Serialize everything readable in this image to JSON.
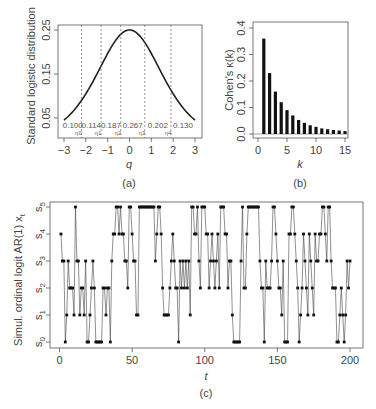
{
  "chart_data": [
    {
      "panel": "(a)",
      "type": "line",
      "title": "",
      "xlabel": "q",
      "ylabel": "Standard logistic distribution",
      "xlim": [
        -3,
        3
      ],
      "ylim": [
        0.0,
        0.25
      ],
      "xticks": [
        -3,
        -2,
        -1,
        0,
        1,
        2,
        3
      ],
      "yticks": [
        0.05,
        0.15,
        0.25
      ],
      "function": "logistic pdf e^-q/(1+e^-q)^2",
      "thresholds": [
        {
          "name": "η0",
          "q": -2.2
        },
        {
          "name": "η1",
          "q": -1.3
        },
        {
          "name": "η2",
          "q": -0.4
        },
        {
          "name": "η3",
          "q": 0.7
        },
        {
          "name": "η4",
          "q": 1.9
        }
      ],
      "region_probabilities": [
        "0.100",
        "0.114",
        "0.187",
        "0.267",
        "0.202",
        "0.130"
      ],
      "grid": false
    },
    {
      "panel": "(b)",
      "type": "bar",
      "title": "",
      "xlabel": "k",
      "ylabel": "Cohen's κ(k)",
      "xlim": [
        0,
        15
      ],
      "ylim": [
        0.0,
        0.4
      ],
      "xticks": [
        0,
        5,
        10,
        15
      ],
      "yticks": [
        0.0,
        0.1,
        0.2,
        0.3,
        0.4
      ],
      "categories": [
        1,
        2,
        3,
        4,
        5,
        6,
        7,
        8,
        9,
        10,
        11,
        12,
        13,
        14,
        15
      ],
      "values": [
        0.36,
        0.23,
        0.16,
        0.12,
        0.09,
        0.07,
        0.053,
        0.042,
        0.033,
        0.027,
        0.021,
        0.018,
        0.015,
        0.013,
        0.011
      ],
      "grid": false
    },
    {
      "panel": "(c)",
      "type": "line",
      "title": "",
      "xlabel": "t",
      "ylabel": "Simul. ordinal logit AR(1) x_t",
      "xlim": [
        0,
        200
      ],
      "xticks": [
        0,
        50,
        100,
        150,
        200
      ],
      "ylevels": [
        "s0",
        "s1",
        "s2",
        "s3",
        "s4",
        "s5"
      ],
      "markers": "points connected by lines",
      "values": [
        4,
        3,
        3,
        0,
        1,
        3,
        2,
        2,
        2,
        1,
        5,
        3,
        3,
        1,
        2,
        2,
        1,
        3,
        0,
        0,
        1,
        2,
        3,
        2,
        0,
        0,
        0,
        0,
        0,
        2,
        2,
        1,
        2,
        2,
        0,
        3,
        4,
        4,
        5,
        5,
        4,
        5,
        4,
        4,
        3,
        3,
        2,
        5,
        5,
        4,
        3,
        3,
        1,
        1,
        5,
        5,
        5,
        5,
        5,
        5,
        5,
        5,
        5,
        5,
        5,
        3,
        4,
        5,
        5,
        4,
        2,
        1,
        1,
        1,
        1,
        2,
        3,
        4,
        3,
        2,
        2,
        0,
        3,
        2,
        3,
        2,
        3,
        2,
        3,
        1,
        5,
        5,
        4,
        4,
        5,
        3,
        2,
        5,
        5,
        5,
        4,
        4,
        2,
        3,
        4,
        3,
        2,
        3,
        4,
        2,
        5,
        5,
        5,
        4,
        4,
        2,
        3,
        3,
        1,
        0,
        0,
        0,
        0,
        0,
        3,
        5,
        2,
        2,
        4,
        5,
        5,
        5,
        5,
        5,
        5,
        5,
        5,
        3,
        2,
        2,
        0,
        3,
        2,
        2,
        2,
        3,
        5,
        5,
        4,
        3,
        2,
        2,
        1,
        3,
        0,
        0,
        0,
        4,
        4,
        5,
        5,
        4,
        3,
        2,
        0,
        1,
        2,
        4,
        3,
        2,
        1,
        4,
        3,
        2,
        1,
        4,
        3,
        3,
        4,
        4,
        5,
        5,
        4,
        3,
        5,
        5,
        3,
        2,
        2,
        2,
        0,
        0,
        1,
        2,
        1,
        0,
        1,
        3,
        2,
        3
      ]
    }
  ],
  "captions": {
    "a": "(a)",
    "b": "(b)",
    "c": "(c)"
  },
  "labels": {
    "a_xlabel": "q",
    "a_ylabel": "Standard logistic distribution",
    "b_xlabel": "k",
    "b_ylabel": "Cohen's κ(k)",
    "c_xlabel": "t",
    "c_ylabel": "Simul. ordinal logit AR(1) x"
  }
}
